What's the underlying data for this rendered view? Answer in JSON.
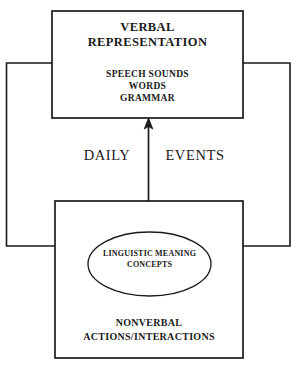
{
  "diagram": {
    "canvas": {
      "width": 298,
      "height": 373,
      "background": "#ffffff"
    },
    "stroke_color": "#1a1a1a",
    "top_box": {
      "name": "verbal-representation-box",
      "heading": "VERBAL\nREPRESENTATION",
      "details": "SPEECH SOUNDS\nWORDS\nGRAMMAR"
    },
    "bottom_box": {
      "name": "nonverbal-actions-box",
      "label": "NONVERBAL\nACTIONS/INTERACTIONS",
      "ellipse": {
        "name": "linguistic-meaning-ellipse",
        "text": "LINGUISTIC MEANING\nCONCEPTS"
      }
    },
    "arrow": {
      "name": "upward-arrow",
      "direction": "up",
      "from": "nonverbal-actions-box",
      "to": "verbal-representation-box"
    },
    "middle_labels": {
      "left": "DAILY",
      "right": "EVENTS"
    },
    "connectors": {
      "left_loop": "left feedback connector",
      "right_loop": "right feedback connector"
    }
  }
}
